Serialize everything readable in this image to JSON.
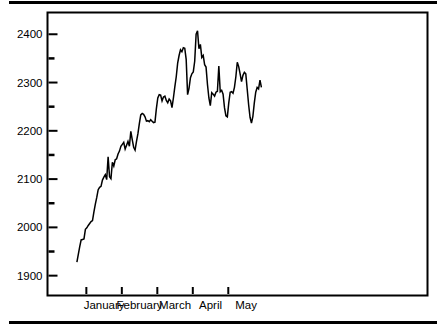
{
  "chart_data": {
    "type": "line",
    "title": "",
    "subtitle": "",
    "xlabel": "",
    "ylabel": "",
    "grid": false,
    "legend": "none",
    "xlim": [
      0,
      160
    ],
    "ylim": [
      1862,
      2443
    ],
    "y_major_ticks": [
      1900,
      2000,
      2100,
      2200,
      2300,
      2400
    ],
    "y_minor_ticks": [
      1950,
      2050,
      2150,
      2250,
      2350
    ],
    "y_tick_labels": [
      "1900",
      "2000",
      "2100",
      "2200",
      "2300",
      "2400"
    ],
    "x_tick_positions": [
      16,
      31,
      46,
      61,
      76
    ],
    "x_category_labels": [
      "January",
      "February",
      "March",
      "April",
      "May"
    ],
    "x_label_positions": [
      23.5,
      38.5,
      53.5,
      68.5,
      83.5
    ],
    "series": [
      {
        "name": "series-1",
        "line_color": "#000000",
        "x": [
          12.0,
          12.6,
          13.2,
          13.8,
          14.4,
          15.0,
          15.6,
          16.2,
          16.8,
          17.4,
          18.0,
          18.6,
          19.2,
          19.8,
          20.4,
          21.0,
          21.6,
          22.2,
          22.8,
          23.4,
          24.0,
          24.6,
          25.2,
          25.8,
          26.4,
          27.0,
          27.6,
          28.2,
          28.8,
          29.4,
          30.0,
          30.6,
          31.2,
          31.8,
          32.4,
          33.0,
          33.6,
          34.2,
          34.8,
          35.4,
          36.0,
          36.6,
          37.2,
          37.8,
          38.4,
          39.0,
          39.6,
          40.2,
          40.8,
          41.4,
          42.0,
          42.6,
          43.2,
          43.8,
          44.4,
          45.0,
          45.6,
          46.2,
          46.8,
          47.4,
          48.0,
          48.6,
          49.2,
          49.8,
          50.4,
          51.0,
          51.6,
          52.2,
          52.8,
          53.4,
          54.0,
          54.6,
          55.2,
          55.8,
          56.4,
          57.0,
          57.6,
          58.2,
          58.8,
          59.4,
          60.0,
          60.6,
          61.2,
          61.8,
          62.4,
          63.0,
          63.6,
          64.2,
          64.8,
          65.4,
          66.0,
          66.6,
          67.2,
          67.8,
          68.4,
          69.0,
          69.6,
          70.2,
          70.8,
          71.4,
          72.0,
          72.6,
          73.2,
          73.8,
          74.4,
          75.0,
          75.6,
          76.2,
          76.8,
          77.4,
          78.0,
          78.6,
          79.2,
          79.8,
          80.4,
          81.0,
          81.6,
          82.2,
          82.8,
          83.4,
          84.0,
          84.6,
          85.2,
          85.8,
          86.4,
          87.0,
          87.6,
          88.2,
          88.8,
          89.4,
          90.0
        ],
        "y": [
          1928,
          1944,
          1960,
          1974,
          1975,
          1976,
          1996,
          1999,
          2004,
          2008,
          2012,
          2014,
          2032,
          2048,
          2062,
          2078,
          2083,
          2085,
          2098,
          2104,
          2109,
          2099,
          2146,
          2105,
          2101,
          2135,
          2127,
          2140,
          2142,
          2152,
          2158,
          2168,
          2172,
          2176,
          2162,
          2170,
          2178,
          2168,
          2199,
          2182,
          2166,
          2160,
          2178,
          2194,
          2215,
          2233,
          2236,
          2234,
          2229,
          2220,
          2221,
          2219,
          2223,
          2220,
          2217,
          2218,
          2246,
          2268,
          2275,
          2274,
          2262,
          2270,
          2272,
          2263,
          2258,
          2266,
          2262,
          2248,
          2268,
          2291,
          2312,
          2340,
          2356,
          2368,
          2364,
          2372,
          2371,
          2348,
          2275,
          2288,
          2310,
          2318,
          2322,
          2344,
          2400,
          2407,
          2370,
          2379,
          2352,
          2356,
          2337,
          2332,
          2296,
          2268,
          2252,
          2279,
          2276,
          2272,
          2280,
          2282,
          2334,
          2281,
          2284,
          2276,
          2248,
          2231,
          2229,
          2258,
          2280,
          2281,
          2278,
          2290,
          2312,
          2342,
          2333,
          2318,
          2302,
          2315,
          2321,
          2318,
          2286,
          2254,
          2228,
          2216,
          2230,
          2258,
          2280,
          2290,
          2287,
          2305,
          2290
        ]
      }
    ]
  }
}
